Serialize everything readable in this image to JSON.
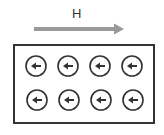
{
  "field": {
    "label": "H",
    "direction": "right",
    "arrow_color": "#999999"
  },
  "domains": {
    "rows": 2,
    "cols": 4,
    "moment_direction": "left",
    "items": [
      {
        "row": 0,
        "col": 0,
        "direction": "left"
      },
      {
        "row": 0,
        "col": 1,
        "direction": "left"
      },
      {
        "row": 0,
        "col": 2,
        "direction": "left"
      },
      {
        "row": 0,
        "col": 3,
        "direction": "left"
      },
      {
        "row": 1,
        "col": 0,
        "direction": "left"
      },
      {
        "row": 1,
        "col": 1,
        "direction": "left"
      },
      {
        "row": 1,
        "col": 2,
        "direction": "left"
      },
      {
        "row": 1,
        "col": 3,
        "direction": "left"
      }
    ]
  },
  "colors": {
    "outline": "#333333",
    "field_arrow": "#999999",
    "background": "#ffffff"
  }
}
